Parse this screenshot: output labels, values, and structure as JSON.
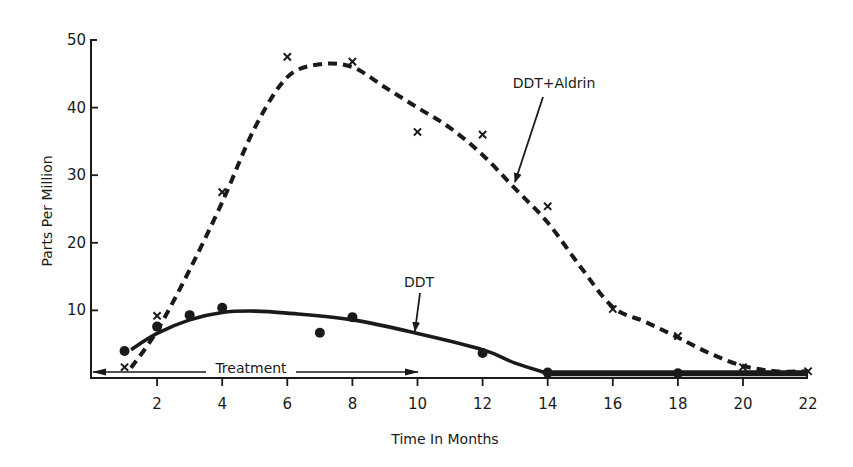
{
  "chart_data": {
    "type": "line",
    "title": "",
    "xlabel": "Time In Months",
    "ylabel": "Parts Per Million",
    "xlim": [
      0,
      22
    ],
    "ylim": [
      0,
      50
    ],
    "xticks": [
      2,
      4,
      6,
      8,
      10,
      12,
      14,
      16,
      18,
      20,
      22
    ],
    "yticks": [
      10,
      20,
      30,
      40,
      50
    ],
    "grid": false,
    "legend": "none (series labelled with arrow annotations)",
    "series": [
      {
        "name": "DDT+Aldrin",
        "style": "dashed",
        "marker": "x",
        "points": [
          {
            "x": 1,
            "y": 1.6
          },
          {
            "x": 2,
            "y": 9.2
          },
          {
            "x": 4,
            "y": 27.5
          },
          {
            "x": 6,
            "y": 47.5
          },
          {
            "x": 8,
            "y": 46.8
          },
          {
            "x": 10,
            "y": 36.4
          },
          {
            "x": 12,
            "y": 36.0
          },
          {
            "x": 14,
            "y": 25.4
          },
          {
            "x": 16,
            "y": 10.2
          },
          {
            "x": 18,
            "y": 6.2
          },
          {
            "x": 20,
            "y": 1.6
          },
          {
            "x": 22,
            "y": 1.0
          }
        ],
        "fitted_curve": [
          {
            "x": 1.2,
            "y": 1.5
          },
          {
            "x": 2,
            "y": 7
          },
          {
            "x": 3,
            "y": 16
          },
          {
            "x": 4,
            "y": 26
          },
          {
            "x": 5,
            "y": 37
          },
          {
            "x": 6,
            "y": 44.5
          },
          {
            "x": 7,
            "y": 46.4
          },
          {
            "x": 8,
            "y": 46
          },
          {
            "x": 9,
            "y": 43
          },
          {
            "x": 10,
            "y": 40
          },
          {
            "x": 11,
            "y": 37
          },
          {
            "x": 12,
            "y": 33
          },
          {
            "x": 13,
            "y": 28
          },
          {
            "x": 14,
            "y": 23
          },
          {
            "x": 15,
            "y": 16.5
          },
          {
            "x": 16,
            "y": 10.5
          },
          {
            "x": 17,
            "y": 8.3
          },
          {
            "x": 18,
            "y": 6
          },
          {
            "x": 19,
            "y": 3.6
          },
          {
            "x": 20,
            "y": 1.8
          },
          {
            "x": 21,
            "y": 1
          },
          {
            "x": 22,
            "y": 1
          }
        ]
      },
      {
        "name": "DDT",
        "style": "solid",
        "marker": "circle",
        "points": [
          {
            "x": 1,
            "y": 4.0
          },
          {
            "x": 2,
            "y": 7.6
          },
          {
            "x": 3,
            "y": 9.3
          },
          {
            "x": 4,
            "y": 10.4
          },
          {
            "x": 7,
            "y": 6.7
          },
          {
            "x": 8,
            "y": 9.0
          },
          {
            "x": 12,
            "y": 3.7
          },
          {
            "x": 14,
            "y": 0.8
          },
          {
            "x": 18,
            "y": 0.7
          }
        ],
        "fitted_curve": [
          {
            "x": 1.2,
            "y": 4.2
          },
          {
            "x": 2,
            "y": 6.6
          },
          {
            "x": 3,
            "y": 8.6
          },
          {
            "x": 4,
            "y": 9.7
          },
          {
            "x": 5,
            "y": 9.9
          },
          {
            "x": 6,
            "y": 9.6
          },
          {
            "x": 8,
            "y": 8.6
          },
          {
            "x": 10,
            "y": 6.6
          },
          {
            "x": 12,
            "y": 4.2
          },
          {
            "x": 13,
            "y": 2.2
          },
          {
            "x": 14,
            "y": 0.7
          },
          {
            "x": 18,
            "y": 0.7
          },
          {
            "x": 22,
            "y": 0.7
          }
        ]
      }
    ],
    "annotations": [
      {
        "text": "DDT+Aldrin",
        "arrow_to": {
          "x": 13.2,
          "y": 28.7
        }
      },
      {
        "text": "DDT",
        "arrow_to": {
          "x": 10.2,
          "y": 6.9
        }
      },
      {
        "text": "Treatment",
        "span": [
          0,
          10
        ],
        "type": "double-arrow"
      }
    ]
  },
  "labels": {
    "xlabel": "Time In Months",
    "ylabel": "Parts Per Million",
    "series_a_label": "DDT+Aldrin",
    "series_b_label": "DDT",
    "treatment_label": "Treatment",
    "xtick_labels": [
      "2",
      "4",
      "6",
      "8",
      "10",
      "12",
      "14",
      "16",
      "18",
      "20",
      "22"
    ],
    "ytick_labels": [
      "10",
      "20",
      "30",
      "40",
      "50"
    ]
  },
  "colors": {
    "ink": "#1a1a1a",
    "background": "#ffffff"
  }
}
